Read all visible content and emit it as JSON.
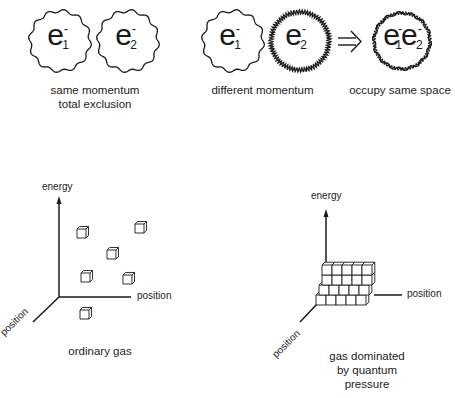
{
  "panels": {
    "same_momentum": {
      "electrons": [
        {
          "symbol": "e",
          "charge": "-",
          "index": "1"
        },
        {
          "symbol": "e",
          "charge": "-",
          "index": "2"
        }
      ],
      "caption_line1": "same momentum",
      "caption_line2": "total exclusion"
    },
    "different_momentum": {
      "electrons": [
        {
          "symbol": "e",
          "charge": "-",
          "index": "1"
        },
        {
          "symbol": "e",
          "charge": "-",
          "index": "2"
        }
      ],
      "caption": "different momentum",
      "arrow": "⇒"
    },
    "occupy_same_space": {
      "electrons": [
        {
          "symbol": "e",
          "charge": "-",
          "index": "1"
        },
        {
          "symbol": "e",
          "charge": "-",
          "index": "2"
        }
      ],
      "caption": "occupy same space"
    },
    "ordinary_gas": {
      "y_axis_label": "energy",
      "x_axis_label": "position",
      "z_axis_label": "position",
      "caption": "ordinary gas",
      "particle_count": 6
    },
    "quantum_gas": {
      "y_axis_label": "energy",
      "x_axis_label": "position",
      "z_axis_label": "position",
      "caption_line1": "gas dominated",
      "caption_line2": "by quantum",
      "caption_line3": "pressure",
      "stack_rows": 4,
      "stack_cols": 5
    }
  },
  "colors": {
    "line": "#1a1a1a",
    "background": "#ffffff"
  }
}
